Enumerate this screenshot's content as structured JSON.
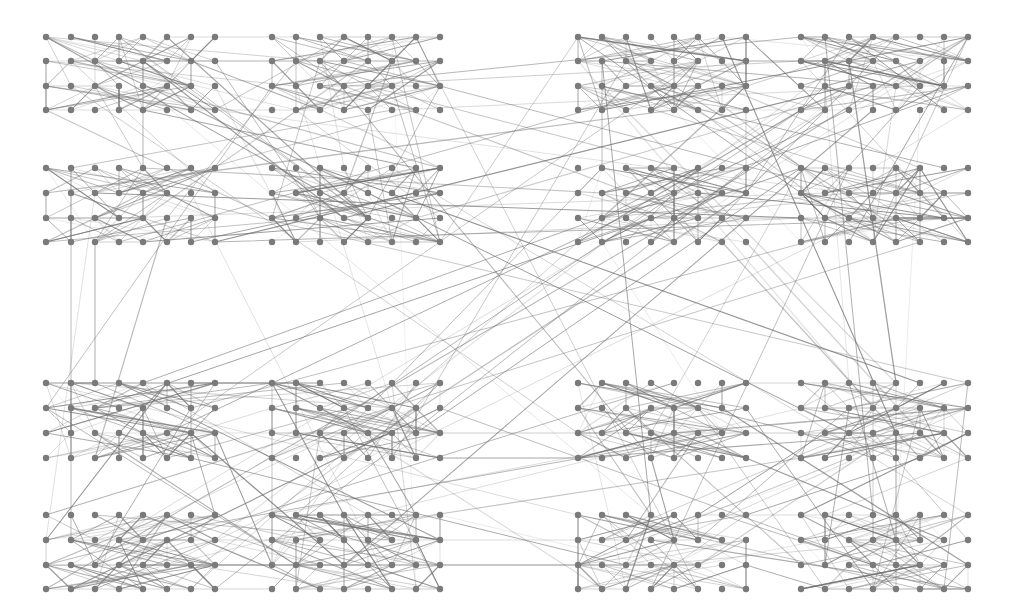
{
  "diagram": {
    "type": "network-graph",
    "canvas": {
      "width": 1017,
      "height": 614,
      "background": "#ffffff"
    },
    "style": {
      "node_color": "#7a7a7a",
      "node_radius": 3.2,
      "edge_color": "#6e6e6e",
      "edge_width_min": 0.5,
      "edge_width_max": 1.3,
      "edge_opacity_min": 0.18,
      "edge_opacity_max": 0.75
    },
    "layout": {
      "description": "4 quadrants, each 2x2 blocks; each block is 4 rows x 8 columns of nodes",
      "quadrant_columns": [
        [
          [
            46,
            71,
            95,
            119,
            143,
            167,
            191,
            215
          ],
          [
            272,
            296,
            320,
            344,
            368,
            392,
            416,
            440
          ]
        ],
        [
          [
            578,
            602,
            626,
            651,
            674,
            698,
            722,
            746
          ],
          [
            801,
            825,
            849,
            873,
            896,
            920,
            944,
            968
          ]
        ]
      ],
      "quadrant_rows": [
        [
          [
            37,
            61,
            86,
            110
          ],
          [
            168,
            193,
            218,
            242
          ]
        ],
        [
          [
            383,
            408,
            433,
            458
          ],
          [
            515,
            540,
            565,
            589
          ]
        ]
      ],
      "nodes_per_block": 32,
      "blocks_per_quadrant": 4,
      "quadrant_count": 4,
      "total_nodes": 512
    },
    "edges": {
      "seed": 1337,
      "intra_block_per_node": 2.2,
      "intra_quadrant_cross_block": 150,
      "inter_quadrant": 70,
      "notable": [
        {
          "from": [
            95,
            242
          ],
          "to": [
            95,
            383
          ]
        },
        {
          "from": [
            440,
            458
          ],
          "to": [
            578,
            458
          ]
        },
        {
          "from": [
            440,
            242
          ],
          "to": [
            578,
            37
          ]
        },
        {
          "from": [
            215,
            242
          ],
          "to": [
            968,
            218
          ]
        },
        {
          "from": [
            578,
            242
          ],
          "to": [
            191,
            589
          ]
        },
        {
          "from": [
            46,
            168
          ],
          "to": [
            968,
            383
          ]
        },
        {
          "from": [
            143,
            383
          ],
          "to": [
            968,
            86
          ]
        },
        {
          "from": [
            416,
            37
          ],
          "to": [
            698,
            589
          ]
        }
      ]
    }
  }
}
